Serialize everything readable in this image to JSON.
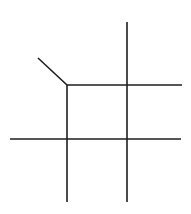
{
  "diagram": {
    "width": 191,
    "height": 214,
    "background": "#ffffff",
    "stroke_color": "#1e1e1e",
    "stroke_width": 1.6,
    "segments": [
      {
        "id": "diagonal",
        "x1": 38,
        "y1": 58,
        "x2": 67,
        "y2": 85
      },
      {
        "id": "top-horizontal",
        "x1": 67,
        "y1": 85,
        "x2": 182,
        "y2": 85
      },
      {
        "id": "bottom-horizontal",
        "x1": 10,
        "y1": 139,
        "x2": 181,
        "y2": 139
      },
      {
        "id": "left-vertical",
        "x1": 67,
        "y1": 85,
        "x2": 67,
        "y2": 202
      },
      {
        "id": "right-vertical",
        "x1": 127,
        "y1": 22,
        "x2": 127,
        "y2": 202
      }
    ]
  }
}
